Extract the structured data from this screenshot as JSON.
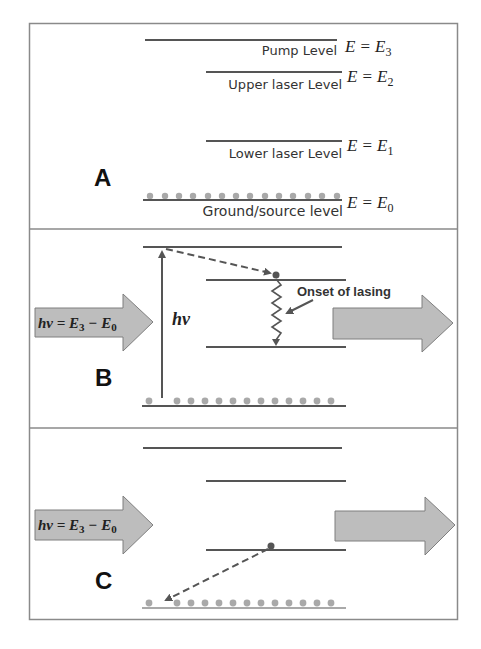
{
  "diagram": {
    "colors": {
      "frame": "#8a8a8a",
      "level_line": "#555555",
      "ground_dot": "#a9a9a9",
      "arrow_fill": "#bdbdbd",
      "arrow_stroke": "#7f7f7f",
      "electron": "#555555",
      "dashed": "#555555"
    },
    "panels": [
      {
        "letter": "A",
        "levels": [
          {
            "label": "Pump Level",
            "equation": {
              "lhs": "E",
              "op": "=",
              "rhs": "E",
              "sub": "3"
            }
          },
          {
            "label": "Upper laser Level",
            "equation": {
              "lhs": "E",
              "op": "=",
              "rhs": "E",
              "sub": "2"
            }
          },
          {
            "label": "Lower laser Level",
            "equation": {
              "lhs": "E",
              "op": "=",
              "rhs": "E",
              "sub": "1"
            }
          },
          {
            "label": "Ground/source level",
            "equation": {
              "lhs": "E",
              "op": "=",
              "rhs": "E",
              "sub": "0"
            }
          }
        ]
      },
      {
        "letter": "B",
        "input_arrow": {
          "text": "hν = E",
          "sub1": "3",
          "mid": " − E",
          "sub2": "0"
        },
        "pump_label": "hν",
        "annotation": "Onset of lasing"
      },
      {
        "letter": "C",
        "input_arrow": {
          "text": "hν = E",
          "sub1": "3",
          "mid": " − E",
          "sub2": "0"
        }
      }
    ]
  }
}
